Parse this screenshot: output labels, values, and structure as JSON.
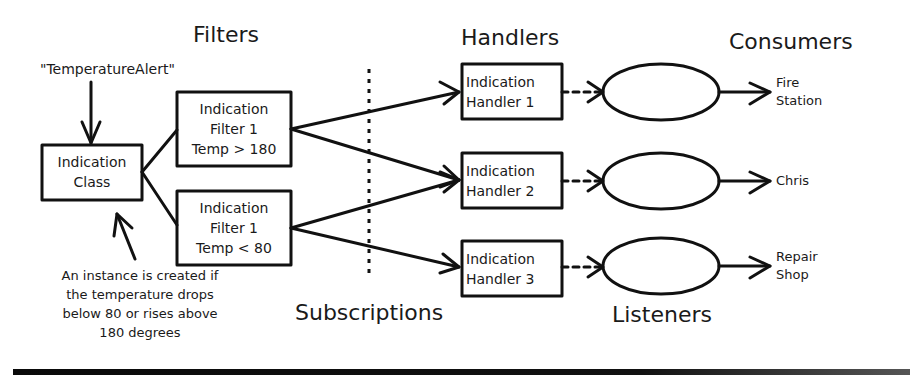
{
  "sections": {
    "filters": "Filters",
    "handlers": "Handlers",
    "consumers": "Consumers",
    "subscriptions": "Subscriptions",
    "listeners": "Listeners"
  },
  "event_name": "\"TemperatureAlert\"",
  "indication_class": {
    "line1": "Indication",
    "line2": "Class"
  },
  "filters": [
    {
      "line1": "Indication",
      "line2": "Filter 1",
      "line3": "Temp > 180"
    },
    {
      "line1": "Indication",
      "line2": "Filter 1",
      "line3": "Temp < 80"
    }
  ],
  "handlers": [
    {
      "line1": "Indication",
      "line2": "Handler 1"
    },
    {
      "line1": "Indication",
      "line2": "Handler 2"
    },
    {
      "line1": "Indication",
      "line2": "Handler 3"
    }
  ],
  "consumers": [
    {
      "line1": "Fire",
      "line2": "Station"
    },
    {
      "line1": "Chris",
      "line2": ""
    },
    {
      "line1": "Repair",
      "line2": "Shop"
    }
  ],
  "note": {
    "line1": "An instance is created if",
    "line2": "the temperature drops",
    "line3": "below 80 or rises above",
    "line4": "180 degrees"
  },
  "colors": {
    "stroke": "#111111",
    "background": "#ffffff"
  }
}
